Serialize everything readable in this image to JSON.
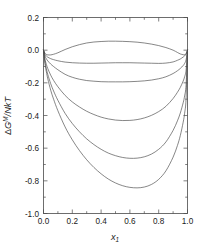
{
  "chart_data": {
    "type": "line",
    "title": "",
    "xlabel": "x_1",
    "xlabel_base": "x",
    "xlabel_sub": "1",
    "ylabel": "ΔG^M/NkT",
    "ylabel_delta": "Δ",
    "ylabel_G": "G",
    "ylabel_sup": "M",
    "ylabel_rest": "/NkT",
    "xlim": [
      0.0,
      1.0
    ],
    "ylim": [
      -1.0,
      0.2
    ],
    "xticks": [
      "0.0",
      "0.2",
      "0.4",
      "0.6",
      "0.8",
      "1.0"
    ],
    "xtick_values": [
      0.0,
      0.2,
      0.4,
      0.6,
      0.8,
      1.0
    ],
    "yticks": [
      "0.2",
      "0.0",
      "-0.2",
      "-0.4",
      "-0.6",
      "-0.8",
      "-1.0"
    ],
    "ytick_values": [
      0.2,
      0.0,
      -0.2,
      -0.4,
      -0.6,
      -0.8,
      -1.0
    ],
    "grid": false,
    "legend": null,
    "frame": "box",
    "tick_direction": "in",
    "line_color": "#454545",
    "x": [
      0.0,
      0.01,
      0.02,
      0.03,
      0.05,
      0.07,
      0.1,
      0.15,
      0.2,
      0.25,
      0.3,
      0.35,
      0.4,
      0.45,
      0.5,
      0.55,
      0.6,
      0.65,
      0.7,
      0.75,
      0.8,
      0.85,
      0.9,
      0.93,
      0.95,
      0.97,
      0.98,
      0.99,
      1.0
    ],
    "series": [
      {
        "name": "curve-1",
        "values": [
          0.0,
          -0.019,
          -0.026,
          -0.029,
          -0.029,
          -0.025,
          -0.016,
          0.004,
          0.021,
          0.034,
          0.044,
          0.05,
          0.053,
          0.055,
          0.055,
          0.054,
          0.052,
          0.049,
          0.044,
          0.037,
          0.028,
          0.016,
          0.0,
          -0.014,
          -0.023,
          -0.028,
          -0.028,
          -0.022,
          0.0
        ]
      },
      {
        "name": "curve-2",
        "values": [
          0.0,
          -0.025,
          -0.036,
          -0.043,
          -0.052,
          -0.058,
          -0.065,
          -0.073,
          -0.077,
          -0.079,
          -0.08,
          -0.08,
          -0.079,
          -0.078,
          -0.077,
          -0.077,
          -0.077,
          -0.078,
          -0.079,
          -0.08,
          -0.081,
          -0.079,
          -0.072,
          -0.062,
          -0.054,
          -0.042,
          -0.035,
          -0.024,
          0.0
        ]
      },
      {
        "name": "curve-3",
        "values": [
          0.0,
          -0.035,
          -0.053,
          -0.066,
          -0.085,
          -0.1,
          -0.12,
          -0.148,
          -0.166,
          -0.178,
          -0.186,
          -0.19,
          -0.193,
          -0.194,
          -0.194,
          -0.194,
          -0.193,
          -0.191,
          -0.188,
          -0.183,
          -0.175,
          -0.163,
          -0.143,
          -0.126,
          -0.112,
          -0.094,
          -0.081,
          -0.06,
          0.0
        ]
      },
      {
        "name": "curve-4",
        "values": [
          0.0,
          -0.055,
          -0.087,
          -0.113,
          -0.153,
          -0.185,
          -0.224,
          -0.277,
          -0.317,
          -0.348,
          -0.374,
          -0.394,
          -0.41,
          -0.421,
          -0.428,
          -0.431,
          -0.43,
          -0.425,
          -0.415,
          -0.399,
          -0.376,
          -0.344,
          -0.296,
          -0.258,
          -0.228,
          -0.189,
          -0.163,
          -0.123,
          0.0
        ]
      },
      {
        "name": "curve-5",
        "values": [
          0.0,
          -0.07,
          -0.113,
          -0.149,
          -0.205,
          -0.25,
          -0.307,
          -0.387,
          -0.449,
          -0.5,
          -0.543,
          -0.578,
          -0.607,
          -0.63,
          -0.646,
          -0.657,
          -0.662,
          -0.661,
          -0.653,
          -0.636,
          -0.607,
          -0.562,
          -0.491,
          -0.433,
          -0.385,
          -0.322,
          -0.28,
          -0.214,
          0.0
        ]
      },
      {
        "name": "curve-6",
        "values": [
          0.0,
          -0.082,
          -0.133,
          -0.176,
          -0.245,
          -0.3,
          -0.371,
          -0.47,
          -0.549,
          -0.615,
          -0.671,
          -0.718,
          -0.757,
          -0.789,
          -0.813,
          -0.83,
          -0.84,
          -0.843,
          -0.838,
          -0.822,
          -0.791,
          -0.739,
          -0.655,
          -0.584,
          -0.523,
          -0.441,
          -0.386,
          -0.298,
          0.0
        ]
      }
    ]
  }
}
